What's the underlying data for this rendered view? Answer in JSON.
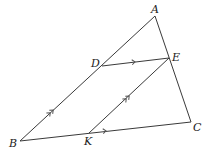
{
  "diagram": {
    "type": "geometry",
    "points": {
      "A": {
        "label": "A",
        "x": 155,
        "y": 16
      },
      "B": {
        "label": "B",
        "x": 20,
        "y": 141
      },
      "C": {
        "label": "C",
        "x": 191,
        "y": 122
      },
      "D": {
        "label": "D",
        "x": 102,
        "y": 66
      },
      "E": {
        "label": "E",
        "x": 169,
        "y": 58
      },
      "K": {
        "label": "K",
        "x": 89,
        "y": 133
      }
    },
    "segments": [
      {
        "from": "A",
        "to": "B",
        "marker": "none"
      },
      {
        "from": "A",
        "to": "C",
        "marker": "none"
      },
      {
        "from": "B",
        "to": "C",
        "marker": "none"
      },
      {
        "from": "D",
        "to": "E",
        "marker": "single-arrow"
      },
      {
        "from": "K",
        "to": "E",
        "marker": "double-arrow"
      },
      {
        "from": "B",
        "to": "D",
        "marker": "double-arrow"
      },
      {
        "from": "B",
        "to": "K",
        "marker": "single-arrow"
      }
    ],
    "labels": {
      "A": "A",
      "B": "B",
      "C": "C",
      "D": "D",
      "E": "E",
      "K": "K"
    },
    "colors": {
      "line": "#3a3a3a",
      "text": "#222222",
      "background": "#ffffff"
    }
  }
}
